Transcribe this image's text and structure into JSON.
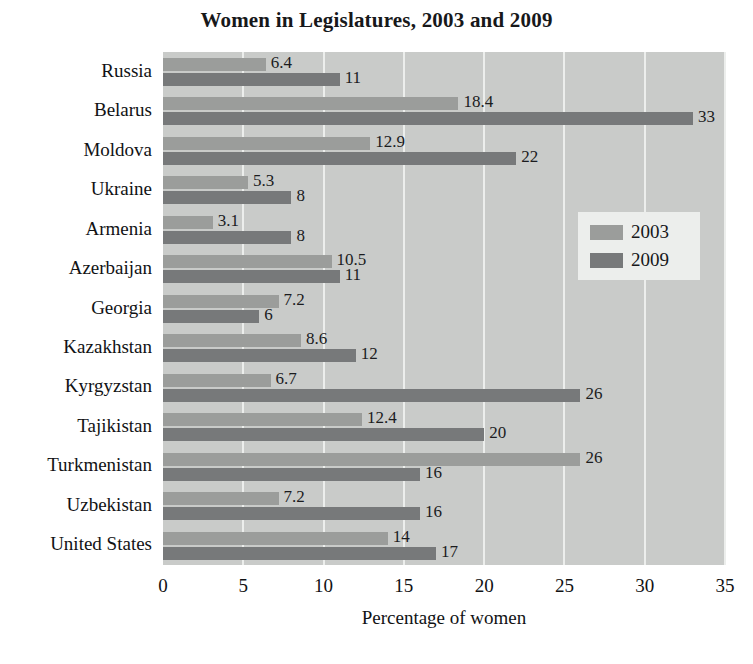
{
  "chart_data": {
    "type": "bar",
    "orientation": "horizontal",
    "title": "Women in Legislatures, 2003 and 2009",
    "xlabel": "Percentage of women",
    "ylabel": "",
    "xlim": [
      0,
      35
    ],
    "xticks": [
      "0",
      "5",
      "10",
      "15",
      "20",
      "25",
      "30",
      "35"
    ],
    "grid": true,
    "legend_position": "center-right",
    "categories": [
      "Russia",
      "Belarus",
      "Moldova",
      "Ukraine",
      "Armenia",
      "Azerbaijan",
      "Georgia",
      "Kazakhstan",
      "Kyrgyzstan",
      "Tajikistan",
      "Turkmenistan",
      "Uzbekistan",
      "United States"
    ],
    "series": [
      {
        "name": "2003",
        "color": "#9b9d9b",
        "values": [
          6.4,
          18.4,
          12.9,
          5.3,
          3.1,
          10.5,
          7.2,
          8.6,
          6.7,
          12.4,
          26,
          7.2,
          14
        ],
        "labels": [
          "6.4",
          "18.4",
          "12.9",
          "5.3",
          "3.1",
          "10.5",
          "7.2",
          "8.6",
          "6.7",
          "12.4",
          "26",
          "7.2",
          "14"
        ]
      },
      {
        "name": "2009",
        "color": "#77797a",
        "values": [
          11,
          33,
          22,
          8,
          8,
          11,
          6,
          12,
          26,
          20,
          16,
          16,
          17
        ],
        "labels": [
          "11",
          "33",
          "22",
          "8",
          "8",
          "11",
          "6",
          "12",
          "26",
          "20",
          "16",
          "16",
          "17"
        ]
      }
    ]
  },
  "legend": {
    "items": [
      {
        "label": "2003"
      },
      {
        "label": "2009"
      }
    ]
  },
  "colors": {
    "plot_background": "#c9cbc9",
    "gridline": "#eceeec",
    "series_2003": "#9b9d9b",
    "series_2009": "#77797a",
    "text": "#111214",
    "page_background": "#ffffff"
  }
}
